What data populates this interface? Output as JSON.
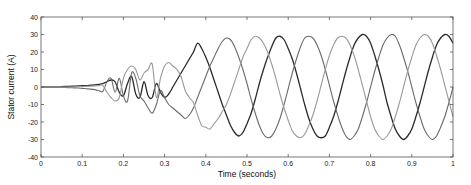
{
  "chart_data": {
    "type": "line",
    "title": "",
    "xlabel": "Time (seconds)",
    "ylabel": "Stator current (A)",
    "xlim": [
      0,
      1
    ],
    "ylim": [
      -40,
      40
    ],
    "xticks": [
      0,
      0.1,
      0.2,
      0.3,
      0.4,
      0.5,
      0.6,
      0.7,
      0.8,
      0.9,
      1
    ],
    "xtick_labels": [
      "0",
      "0.1",
      "0.2",
      "0.3",
      "0.4",
      "0.5",
      "0.6",
      "0.7",
      "0.8",
      "0.9",
      "1"
    ],
    "yticks": [
      -40,
      -30,
      -20,
      -10,
      0,
      10,
      20,
      30,
      40
    ],
    "ytick_labels": [
      "-40",
      "-30",
      "-20",
      "-10",
      "0",
      "10",
      "20",
      "30",
      "40"
    ],
    "grid": false,
    "legend": null,
    "x": [
      0,
      0.01,
      0.02,
      0.03,
      0.04,
      0.05,
      0.06,
      0.07,
      0.08,
      0.09,
      0.1,
      0.11,
      0.12,
      0.13,
      0.14,
      0.15,
      0.16,
      0.17,
      0.18,
      0.19,
      0.2,
      0.21,
      0.22,
      0.23,
      0.24,
      0.25,
      0.26,
      0.27,
      0.28,
      0.29,
      0.3,
      0.31,
      0.32,
      0.33,
      0.34,
      0.35,
      0.36,
      0.37,
      0.38,
      0.39,
      0.4,
      0.41,
      0.42,
      0.43,
      0.44,
      0.45,
      0.46,
      0.47,
      0.48,
      0.49,
      0.5,
      0.51,
      0.52,
      0.53,
      0.54,
      0.55,
      0.56,
      0.57,
      0.58,
      0.59,
      0.6,
      0.61,
      0.62,
      0.63,
      0.64,
      0.65,
      0.66,
      0.67,
      0.68,
      0.69,
      0.7,
      0.71,
      0.72,
      0.73,
      0.74,
      0.75,
      0.76,
      0.77,
      0.78,
      0.79,
      0.8,
      0.81,
      0.82,
      0.83,
      0.84,
      0.85,
      0.86,
      0.87,
      0.88,
      0.89,
      0.9,
      0.91,
      0.92,
      0.93,
      0.94,
      0.95,
      0.96,
      0.97,
      0.98,
      0.99,
      1
    ],
    "series": [
      {
        "name": "Phase A",
        "color": "#2a2a2a",
        "values": [
          0,
          0,
          0,
          0,
          0,
          0.2,
          0.3,
          0.4,
          0.5,
          0.6,
          0.7,
          0.8,
          1,
          1.2,
          1.5,
          2,
          3,
          4,
          3,
          -3,
          -5,
          2,
          6,
          -4,
          -6,
          3,
          -5,
          -6,
          2,
          -3,
          -6,
          -4,
          0,
          4,
          8,
          12,
          16,
          20,
          25,
          22,
          17,
          11,
          4,
          -3,
          -10,
          -16,
          -22,
          -26,
          -28,
          -26,
          -21,
          -15,
          -7,
          2,
          10,
          17,
          23,
          28,
          29,
          27,
          22,
          16,
          8,
          -1,
          -10,
          -18,
          -24,
          -28,
          -29,
          -28,
          -23,
          -17,
          -9,
          0,
          9,
          17,
          24,
          28,
          30,
          29,
          25,
          18,
          10,
          1,
          -9,
          -17,
          -24,
          -28,
          -30,
          -28,
          -24,
          -17,
          -9,
          0,
          9,
          17,
          24,
          28,
          30,
          29,
          25
        ]
      },
      {
        "name": "Phase B",
        "color": "#6a6a6a",
        "values": [
          0,
          0,
          0,
          0,
          0,
          -0.2,
          -0.3,
          -0.4,
          -0.5,
          -0.6,
          -0.8,
          -1,
          -1.2,
          -1.5,
          -2,
          -2.5,
          3,
          5,
          -3,
          5,
          -5,
          -8,
          8,
          5,
          -5,
          -8,
          -12,
          -15,
          -10,
          -2,
          -6,
          -10,
          -12,
          -14,
          -16,
          -18,
          -16,
          -12,
          -6,
          0,
          6,
          12,
          17,
          22,
          26,
          28,
          27,
          23,
          17,
          10,
          2,
          -7,
          -15,
          -22,
          -27,
          -29,
          -28,
          -24,
          -18,
          -10,
          -1,
          8,
          16,
          23,
          28,
          29,
          28,
          24,
          18,
          10,
          1,
          -8,
          -16,
          -23,
          -28,
          -30,
          -28,
          -24,
          -17,
          -9,
          0,
          9,
          17,
          24,
          28,
          30,
          29,
          24,
          17,
          9,
          0,
          -9,
          -17,
          -24,
          -28,
          -30,
          -28,
          -23,
          -17,
          -9,
          0
        ]
      },
      {
        "name": "Phase C",
        "color": "#9a9a9a",
        "values": [
          0,
          0,
          0,
          0,
          0,
          0,
          0,
          0,
          0,
          0.2,
          0.3,
          0.4,
          0.5,
          0.6,
          0.8,
          1,
          -3,
          -6,
          -8,
          -6,
          5,
          10,
          12,
          10,
          4,
          8,
          10,
          13,
          -6,
          5,
          12,
          14,
          12,
          10,
          6,
          -2,
          -6,
          -9,
          -16,
          -22,
          -23,
          -24,
          -21,
          -18,
          -14,
          -10,
          -4,
          3,
          10,
          17,
          22,
          27,
          29,
          28,
          25,
          20,
          13,
          5,
          -4,
          -12,
          -19,
          -25,
          -28,
          -29,
          -27,
          -22,
          -16,
          -8,
          1,
          10,
          18,
          24,
          28,
          29,
          28,
          24,
          18,
          10,
          1,
          -8,
          -17,
          -24,
          -28,
          -30,
          -28,
          -24,
          -17,
          -9,
          0,
          9,
          17,
          24,
          28,
          30,
          29,
          25,
          18,
          10,
          1,
          -8,
          -17
        ]
      }
    ]
  },
  "plot_area": {
    "left": 41,
    "top": 17,
    "right": 453,
    "bottom": 157
  }
}
